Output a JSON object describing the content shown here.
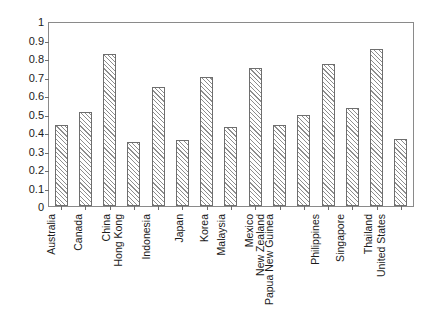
{
  "chart_data": {
    "type": "bar",
    "title": "",
    "subtitle": "",
    "xlabel": "",
    "ylabel": "",
    "ylim": [
      0,
      1
    ],
    "xlim_note": "categorical",
    "grid": false,
    "legend": null,
    "y_ticks": [
      "0",
      "0.1",
      "0.2",
      "0.3",
      "0.4",
      "0.5",
      "0.6",
      "0.7",
      "0.8",
      "0.9",
      "1"
    ],
    "y_tick_values": [
      0,
      0.1,
      0.2,
      0.3,
      0.4,
      0.5,
      0.6,
      0.7,
      0.8,
      0.9,
      1
    ],
    "categories": [
      "Australia",
      "Canada",
      "China",
      "Hong Kong",
      "Indonesia",
      "Japan",
      "Korea",
      "Malaysia",
      "Mexico",
      "New Zealand",
      "Papua New Guinea",
      "Philippines",
      "Singapore",
      "Thailand",
      "United States"
    ],
    "values": [
      0.44,
      0.51,
      0.82,
      0.345,
      0.645,
      0.355,
      0.695,
      0.425,
      0.745,
      0.44,
      0.49,
      0.77,
      0.53,
      0.85,
      0.36
    ],
    "series": [
      {
        "name": "",
        "values": [
          0.44,
          0.51,
          0.82,
          0.345,
          0.645,
          0.355,
          0.695,
          0.425,
          0.745,
          0.44,
          0.49,
          0.77,
          0.53,
          0.85,
          0.36
        ]
      }
    ],
    "style": {
      "bar_fill": "#ffffff",
      "bar_hatch": "diagonal-forward-slash",
      "bar_hatch_color": "#8d8d8d",
      "bar_border": "#6e6e6e",
      "axis_color": "#8a8a8a",
      "text_color": "#1b1b1b",
      "background": "#ffffff"
    }
  }
}
